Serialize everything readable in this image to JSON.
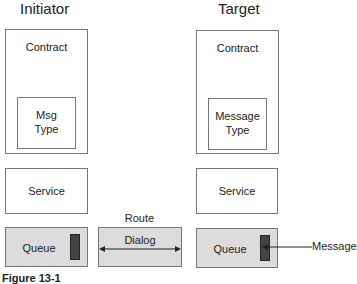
{
  "initiator": {
    "title": "Initiator",
    "contract_label": "Contract",
    "msg_type_line1": "Msg",
    "msg_type_line2": "Type",
    "service_label": "Service",
    "queue_label": "Queue"
  },
  "target": {
    "title": "Target",
    "contract_label": "Contract",
    "msg_type_line1": "Message",
    "msg_type_line2": "Type",
    "service_label": "Service",
    "queue_label": "Queue"
  },
  "route": {
    "route_label": "Route",
    "dialog_label": "Dialog"
  },
  "message_label": "Message",
  "caption": "Figure 13-1",
  "colors": {
    "border": "#777777",
    "gray_fill": "#dcdcdc",
    "bar_fill": "#444444"
  }
}
